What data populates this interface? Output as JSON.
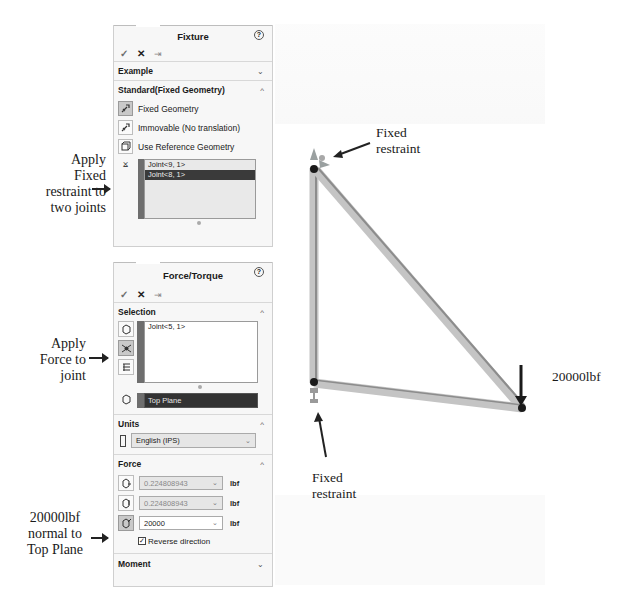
{
  "annotations": {
    "fixed_two_joints": [
      "Apply",
      "Fixed",
      "restraint to",
      "two joints"
    ],
    "force_joint": [
      "Apply",
      "Force to",
      "joint"
    ],
    "force_normal": [
      "20000lbf",
      "normal to",
      "Top Plane"
    ]
  },
  "fixture_panel": {
    "title": "Fixture",
    "help_icon": "?",
    "actions": {
      "ok": "✓",
      "cancel": "✕",
      "pin": "⇥"
    },
    "example_section": {
      "label": "Example",
      "expanded": false
    },
    "standard_section": {
      "label": "Standard(Fixed Geometry)",
      "expanded": true,
      "options": [
        {
          "label": "Fixed Geometry",
          "icon": "fixed-geometry-icon",
          "selected": true
        },
        {
          "label": "Immovable (No translation)",
          "icon": "immovable-icon",
          "selected": false
        },
        {
          "label": "Use Reference Geometry",
          "icon": "reference-geometry-icon",
          "selected": false
        }
      ],
      "joints": [
        "Joint<9, 1>",
        "Joint<8, 1>"
      ],
      "selected_joint_index": 1
    }
  },
  "force_panel": {
    "title": "Force/Torque",
    "help_icon": "?",
    "actions": {
      "ok": "✓",
      "cancel": "✕",
      "pin": "⇥"
    },
    "selection_section": {
      "label": "Selection",
      "expanded": true,
      "items": [
        "Joint<5, 1>"
      ],
      "direction_reference": "Top Plane"
    },
    "units_section": {
      "label": "Units",
      "expanded": true,
      "selected": "English (IPS)"
    },
    "force_section": {
      "label": "Force",
      "expanded": true,
      "components": [
        {
          "value": "0.224808943",
          "unit": "lbf",
          "enabled": false
        },
        {
          "value": "0.224808943",
          "unit": "lbf",
          "enabled": false
        },
        {
          "value": "20000",
          "unit": "lbf",
          "enabled": true
        }
      ],
      "reverse_direction": {
        "label": "Reverse direction",
        "checked": true
      }
    },
    "moment_section": {
      "label": "Moment",
      "expanded": false
    }
  },
  "model_view": {
    "labels": {
      "top_fixed": [
        "Fixed",
        "restraint"
      ],
      "bottom_fixed": [
        "Fixed",
        "restraint"
      ],
      "force": "20000lbf"
    },
    "colors": {
      "beam": "#c8c8c8",
      "beam_dark": "#9a9a9a",
      "joint": "#1a1a1a"
    }
  },
  "chevrons": {
    "up": "^",
    "down": "⌄"
  }
}
